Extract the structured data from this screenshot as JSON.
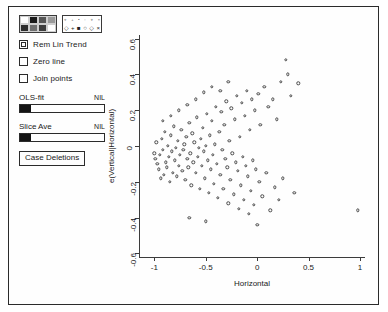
{
  "window": {
    "title": ""
  },
  "panel": {
    "color_palette": {
      "name": "color-shade-palette",
      "swatches": [
        "#ffffff",
        "#1a1a1a",
        "#555555",
        "#9a9a9a",
        "#2e2e2e",
        "#6f6f6f",
        "#3d3d3d",
        "#ffffff"
      ]
    },
    "symbol_palette": {
      "name": "plot-symbol-palette",
      "small_row": [
        "⋄",
        "+",
        "▪",
        "◦",
        "⋄",
        "×"
      ],
      "big_row": [
        "◇",
        "+",
        "■",
        "○",
        "◇",
        "×"
      ]
    },
    "checkboxes": [
      {
        "label": "Rem Lin Trend",
        "checked": true
      },
      {
        "label": "Zero line",
        "checked": false
      },
      {
        "label": "Join points",
        "checked": false
      }
    ],
    "sliders": [
      {
        "label": "OLS-fit",
        "value": "NIL",
        "fill_pct": 0
      },
      {
        "label": "Slice Ave",
        "value": "NIL",
        "fill_pct": 0
      }
    ],
    "buttons": [
      {
        "label": "Case Deletions"
      }
    ]
  },
  "chart_data": {
    "type": "scatter",
    "title": "",
    "xlabel": "Horizontal",
    "ylabel": "e(Vertical|Horizontal)",
    "xlim": [
      -1.15,
      1.05
    ],
    "ylim": [
      -0.62,
      0.62
    ],
    "xticks": [
      -1,
      -0.5,
      0,
      0.5,
      1
    ],
    "xtick_labels": [
      "-1",
      "-0.5",
      "0",
      "0.5",
      "1"
    ],
    "yticks": [
      -0.6,
      -0.4,
      -0.2,
      0,
      0.2,
      0.4,
      0.6
    ],
    "ytick_labels": [
      "-0.6",
      "-0.4",
      "-0.2",
      "0",
      "0.2",
      "0.4",
      "0.6"
    ],
    "grid": false,
    "legend": null,
    "marker": "open-circle",
    "marker_color": "#4a4a4a",
    "n_points": 132,
    "points": [
      [
        -1.0,
        -0.04
      ],
      [
        -0.99,
        -0.07
      ],
      [
        -0.98,
        0.02
      ],
      [
        -0.97,
        -0.1
      ],
      [
        -0.96,
        -0.13
      ],
      [
        -0.95,
        -0.05
      ],
      [
        -0.94,
        -0.18
      ],
      [
        -0.93,
        0.04
      ],
      [
        -0.92,
        -0.02
      ],
      [
        -0.91,
        -0.16
      ],
      [
        -0.9,
        0.08
      ],
      [
        -0.89,
        -0.09
      ],
      [
        -0.88,
        -0.12
      ],
      [
        -0.87,
        0.0
      ],
      [
        -0.86,
        -0.06
      ],
      [
        -0.85,
        -0.2
      ],
      [
        -0.84,
        0.06
      ],
      [
        -0.83,
        -0.03
      ],
      [
        -0.82,
        -0.15
      ],
      [
        -0.81,
        0.11
      ],
      [
        -0.8,
        -0.08
      ],
      [
        -0.79,
        -0.01
      ],
      [
        -0.78,
        -0.17
      ],
      [
        -0.77,
        0.03
      ],
      [
        -0.76,
        -0.11
      ],
      [
        -0.75,
        -0.05
      ],
      [
        -0.74,
        0.09
      ],
      [
        -0.73,
        -0.14
      ],
      [
        -0.72,
        -0.02
      ],
      [
        -0.71,
        0.01
      ],
      [
        -0.7,
        -0.19
      ],
      [
        -0.69,
        0.05
      ],
      [
        -0.68,
        -0.07
      ],
      [
        -0.67,
        -0.12
      ],
      [
        -0.66,
        0.13
      ],
      [
        -0.65,
        -0.04
      ],
      [
        -0.64,
        -0.22
      ],
      [
        -0.63,
        0.07
      ],
      [
        -0.62,
        -0.09
      ],
      [
        -0.61,
        0.02
      ],
      [
        -0.6,
        -0.15
      ],
      [
        -0.59,
        0.16
      ],
      [
        -0.58,
        -0.06
      ],
      [
        -0.57,
        -0.01
      ],
      [
        -0.56,
        -0.24
      ],
      [
        -0.55,
        0.04
      ],
      [
        -0.54,
        -0.11
      ],
      [
        -0.53,
        0.1
      ],
      [
        -0.52,
        -0.03
      ],
      [
        -0.51,
        -0.18
      ],
      [
        -0.5,
        0.0
      ],
      [
        -0.49,
        0.18
      ],
      [
        -0.48,
        -0.08
      ],
      [
        -0.47,
        -0.26
      ],
      [
        -0.46,
        0.06
      ],
      [
        -0.45,
        -0.13
      ],
      [
        -0.44,
        0.14
      ],
      [
        -0.43,
        -0.05
      ],
      [
        -0.42,
        -0.21
      ],
      [
        -0.41,
        0.01
      ],
      [
        -0.4,
        0.22
      ],
      [
        -0.39,
        -0.1
      ],
      [
        -0.38,
        -0.29
      ],
      [
        -0.37,
        0.08
      ],
      [
        -0.36,
        -0.16
      ],
      [
        -0.35,
        0.19
      ],
      [
        -0.34,
        -0.02
      ],
      [
        -0.33,
        -0.24
      ],
      [
        -0.32,
        0.12
      ],
      [
        -0.31,
        -0.07
      ],
      [
        -0.3,
        0.25
      ],
      [
        -0.29,
        -0.12
      ],
      [
        -0.28,
        -0.32
      ],
      [
        -0.27,
        0.03
      ],
      [
        -0.26,
        -0.19
      ],
      [
        -0.25,
        0.21
      ],
      [
        -0.24,
        -0.04
      ],
      [
        -0.23,
        -0.27
      ],
      [
        -0.22,
        0.15
      ],
      [
        -0.21,
        -0.09
      ],
      [
        -0.2,
        0.28
      ],
      [
        -0.19,
        -0.14
      ],
      [
        -0.18,
        -0.35
      ],
      [
        -0.17,
        0.05
      ],
      [
        -0.16,
        -0.22
      ],
      [
        -0.15,
        0.24
      ],
      [
        -0.14,
        -0.06
      ],
      [
        -0.13,
        -0.3
      ],
      [
        -0.12,
        0.17
      ],
      [
        -0.11,
        -0.11
      ],
      [
        -0.1,
        0.31
      ],
      [
        -0.09,
        -0.17
      ],
      [
        -0.08,
        -0.38
      ],
      [
        -0.07,
        0.09
      ],
      [
        -0.06,
        -0.25
      ],
      [
        -0.05,
        0.26
      ],
      [
        -0.04,
        -0.08
      ],
      [
        -0.03,
        -0.33
      ],
      [
        -0.02,
        0.2
      ],
      [
        -0.01,
        -0.13
      ],
      [
        0.0,
        -0.44
      ],
      [
        0.01,
        0.29
      ],
      [
        0.02,
        -0.2
      ],
      [
        0.03,
        0.12
      ],
      [
        0.05,
        -0.28
      ],
      [
        0.07,
        0.33
      ],
      [
        0.09,
        -0.15
      ],
      [
        0.11,
        0.22
      ],
      [
        0.13,
        -0.36
      ],
      [
        0.15,
        0.26
      ],
      [
        0.17,
        -0.23
      ],
      [
        0.19,
        0.15
      ],
      [
        0.21,
        -0.3
      ],
      [
        0.23,
        0.36
      ],
      [
        0.25,
        -0.18
      ],
      [
        0.28,
        0.48
      ],
      [
        0.3,
        0.4
      ],
      [
        0.33,
        0.28
      ],
      [
        0.36,
        -0.26
      ],
      [
        0.4,
        0.35
      ],
      [
        -0.92,
        0.14
      ],
      [
        -0.84,
        0.17
      ],
      [
        -0.76,
        0.2
      ],
      [
        -0.68,
        0.23
      ],
      [
        -0.6,
        0.26
      ],
      [
        -0.52,
        0.3
      ],
      [
        -0.44,
        0.33
      ],
      [
        -0.36,
        0.31
      ],
      [
        -0.28,
        0.36
      ],
      [
        -0.66,
        -0.4
      ],
      [
        -0.5,
        -0.42
      ],
      [
        0.98,
        -0.36
      ]
    ]
  }
}
